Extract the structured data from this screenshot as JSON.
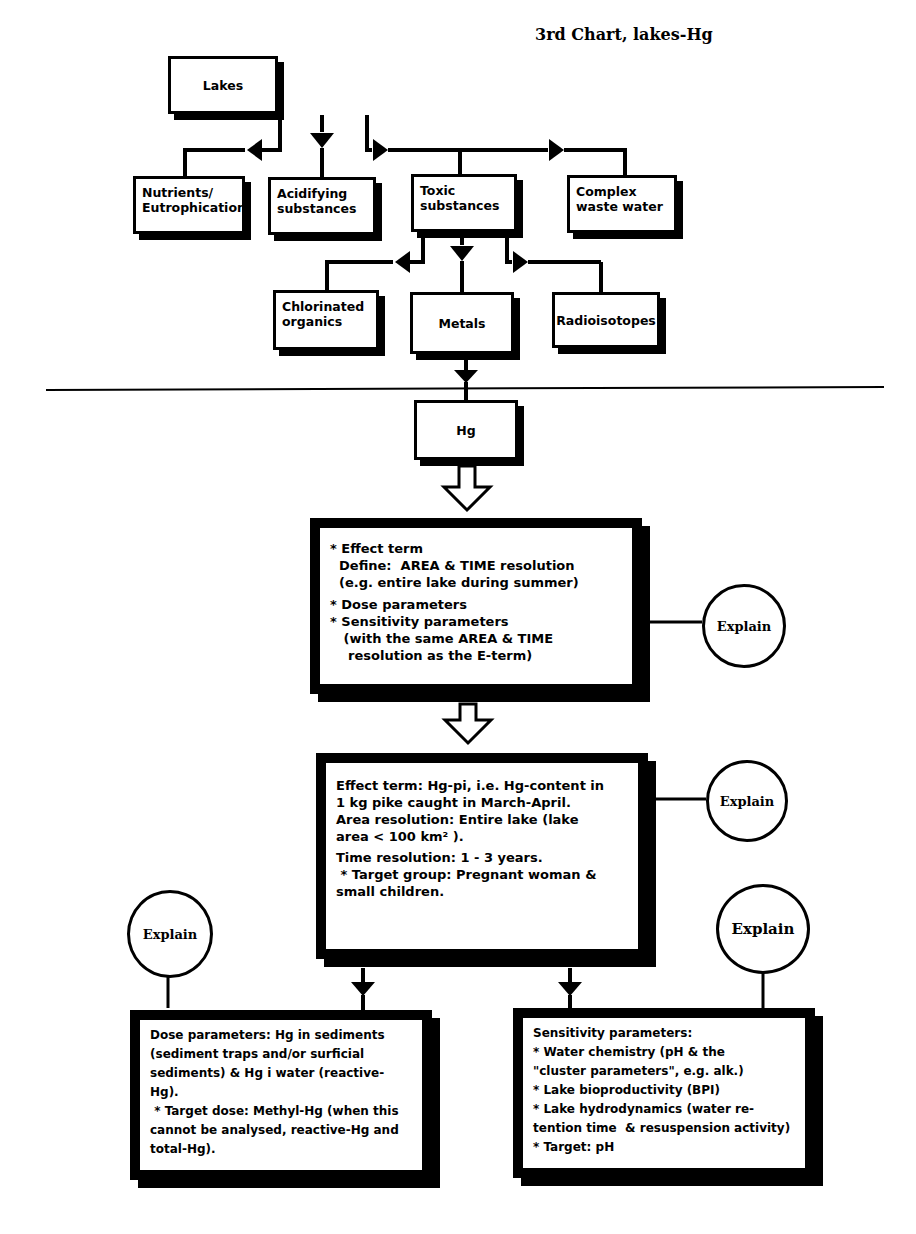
{
  "title": "3rd Chart, lakes-Hg",
  "level1": {
    "root": "Lakes",
    "children": [
      {
        "label": "Nutrients/\nEutrophication"
      },
      {
        "label": "Acidifying\nsubstances"
      },
      {
        "label": "Toxic\nsubstances"
      },
      {
        "label": "Complex\nwaste water"
      }
    ]
  },
  "level2": {
    "children": [
      {
        "label": "Chlorinated\norganics"
      },
      {
        "label": "Metals"
      },
      {
        "label": "Radioisotopes"
      }
    ]
  },
  "hg_box": "Hg",
  "define_box": {
    "lines": [
      "* Effect term",
      "  Define:  AREA & TIME resolution",
      "  (e.g. entire lake during summer)",
      "* Dose parameters",
      "* Sensitivity parameters",
      "   (with the same AREA & TIME",
      "    resolution as the E-term)"
    ]
  },
  "effect_box": {
    "lines": [
      "Effect term: Hg-pi, i.e. Hg-content in",
      "1 kg pike caught in March-April.",
      "Area resolution: Entire lake (lake",
      "area < 100 km² ).",
      "Time resolution: 1 - 3 years.",
      " * Target group: Pregnant woman &",
      "small children."
    ]
  },
  "dose_box": {
    "lines": [
      "Dose parameters: Hg in sediments",
      "(sediment traps and/or surficial",
      "sediments) & Hg i water (reactive-",
      "Hg).",
      " * Target dose: Methyl-Hg (when this",
      "cannot be analysed, reactive-Hg and",
      "total-Hg)."
    ]
  },
  "sensitivity_box": {
    "lines": [
      "Sensitivity parameters:",
      "* Water chemistry (pH & the",
      "\"cluster parameters\", e.g. alk.)",
      "* Lake bioproductivity (BPI)",
      "* Lake hydrodynamics (water re-",
      "tention time  & resuspension activity)",
      "* Target: pH"
    ]
  },
  "explain_buttons": {
    "define": "Explain",
    "effect": "Explain",
    "dose": "Explain",
    "sensitivity": "Explain"
  },
  "icons": {
    "arrow_left": "triangle-left",
    "arrow_right": "triangle-right",
    "arrow_down": "triangle-down",
    "hollow_arrow": "hollow-down-arrow"
  }
}
